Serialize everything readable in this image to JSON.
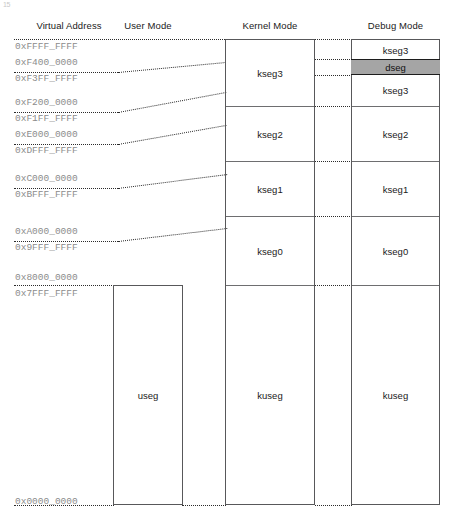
{
  "page": {
    "corner_artifact": "15",
    "width": 452,
    "height": 521
  },
  "headers": {
    "virtual_address": "Virtual Address",
    "user_mode": "User Mode",
    "kernel_mode": "Kernel Mode",
    "debug_mode": "Debug Mode"
  },
  "addresses": [
    {
      "label": "0xFFFF_FFFF",
      "y": 46
    },
    {
      "label": "0xF400_0000",
      "y": 62
    },
    {
      "label": "0xF3FF_FFFF",
      "y": 78
    },
    {
      "label": "0xF200_0000",
      "y": 102
    },
    {
      "label": "0xF1FF_FFFF",
      "y": 118
    },
    {
      "label": "0xE000_0000",
      "y": 134
    },
    {
      "label": "0xDFFF_FFFF",
      "y": 150
    },
    {
      "label": "0xC000_0000",
      "y": 178
    },
    {
      "label": "0xBFFF_FFFF",
      "y": 194
    },
    {
      "label": "0xA000_0000",
      "y": 231
    },
    {
      "label": "0x9FFF_FFFF",
      "y": 247
    },
    {
      "label": "0x8000_0000",
      "y": 277
    },
    {
      "label": "0x7FFF_FFFF",
      "y": 293
    },
    {
      "label": "0x0000_0000",
      "y": 501
    }
  ],
  "columns": {
    "user": {
      "name": "User Mode",
      "segments": [
        {
          "label": "useg",
          "top": 285,
          "bottom": 505
        }
      ]
    },
    "kernel": {
      "name": "Kernel Mode",
      "segments": [
        {
          "label": "kseg3",
          "top": 39,
          "bottom": 106
        },
        {
          "label": "kseg2",
          "top": 106,
          "bottom": 161
        },
        {
          "label": "kseg1",
          "top": 161,
          "bottom": 216
        },
        {
          "label": "kseg0",
          "top": 216,
          "bottom": 285
        },
        {
          "label": "kuseg",
          "top": 285,
          "bottom": 505
        }
      ]
    },
    "debug": {
      "name": "Debug Mode",
      "segments": [
        {
          "label": "kseg3",
          "top": 39,
          "bottom": 59
        },
        {
          "label": "dseg",
          "top": 59,
          "bottom": 75,
          "highlighted": true
        },
        {
          "label": "kseg3",
          "top": 75,
          "bottom": 106
        },
        {
          "label": "kseg2",
          "top": 106,
          "bottom": 161
        },
        {
          "label": "kseg1",
          "top": 161,
          "bottom": 216
        },
        {
          "label": "kseg0",
          "top": 216,
          "bottom": 285
        },
        {
          "label": "kuseg",
          "top": 285,
          "bottom": 505
        }
      ]
    }
  },
  "colors": {
    "dseg_fill": "#a5a5a5",
    "box_border": "#58585a",
    "address_text": "#8c8c8c",
    "label_text": "#1a1a1a",
    "leader_line": "#2b2b2b"
  }
}
